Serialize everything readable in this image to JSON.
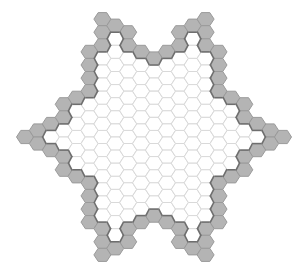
{
  "board": {
    "shape": "hexagram",
    "orientation": "flat-top",
    "center": [
      154,
      137
    ],
    "col_step": 12.9,
    "row_step": 13.1,
    "hex_radius": 8.5,
    "cols": [
      -10,
      10
    ],
    "star_points": [
      [
        25,
        137
      ],
      [
        102,
        19
      ],
      [
        206,
        19
      ],
      [
        283,
        137
      ],
      [
        206,
        255
      ],
      [
        102,
        255
      ]
    ],
    "inner_points": [
      [
        77,
        94
      ],
      [
        154,
        50
      ],
      [
        231,
        94
      ],
      [
        231,
        180
      ],
      [
        154,
        224
      ],
      [
        77,
        180
      ]
    ],
    "colors": {
      "cell_fill": "#ffffff",
      "cell_stroke": "#d9d9d9",
      "wall_fill": "#b4b4b4",
      "wall_stroke": "#9a9a9a",
      "edge_stroke": "#6e6e6e",
      "background": "#ffffff"
    }
  }
}
